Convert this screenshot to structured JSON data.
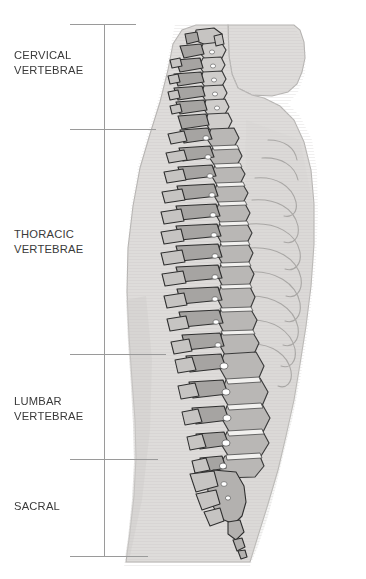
{
  "figure": {
    "background_color": "#ffffff",
    "ink_color": "#3a3a3a",
    "rule_color": "#9a9a9a",
    "body_fill_color": "#dedcda",
    "bone_outline_color": "#2f2f2f"
  },
  "labels": [
    {
      "id": "cervical",
      "text": "CERVICAL\nVERTEBRAE",
      "top_px": 48
    },
    {
      "id": "thoracic",
      "text": "THORACIC\nVERTEBRAE",
      "top_px": 227
    },
    {
      "id": "lumbar",
      "text": "LUMBAR\nVERTEBRAE",
      "top_px": 394
    },
    {
      "id": "sacral",
      "text": "SACRAL",
      "top_px": 499
    }
  ],
  "bracket": {
    "vertical_rule_x_px": 104,
    "vertical_rule_top_px": 24,
    "vertical_rule_bottom_px": 556,
    "ticks": [
      {
        "id": "tick-top",
        "y_px": 24,
        "x_px": 70,
        "width_px": 66
      },
      {
        "id": "tick-cervical-end",
        "y_px": 129,
        "x_px": 70,
        "width_px": 86
      },
      {
        "id": "tick-thoracic-end",
        "y_px": 354,
        "x_px": 70,
        "width_px": 96
      },
      {
        "id": "tick-lumbar-end",
        "y_px": 459,
        "x_px": 70,
        "width_px": 88
      },
      {
        "id": "tick-bottom",
        "y_px": 556,
        "x_px": 70,
        "width_px": 78
      }
    ]
  },
  "regions": [
    {
      "name": "cervical vertebrae",
      "count": 7,
      "span_px": [
        24,
        129
      ]
    },
    {
      "name": "thoracic vertebrae",
      "count": 12,
      "span_px": [
        129,
        354
      ]
    },
    {
      "name": "lumbar vertebrae",
      "count": 5,
      "span_px": [
        354,
        459
      ]
    },
    {
      "name": "sacral",
      "count": 5,
      "span_px": [
        459,
        556
      ]
    }
  ]
}
